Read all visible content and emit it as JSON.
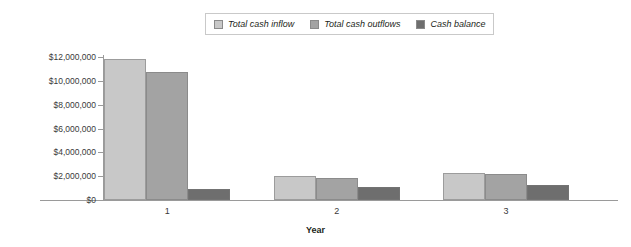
{
  "chart_data": {
    "type": "bar",
    "title": "",
    "subtitle": "",
    "xlabel": "Year",
    "ylabel": "",
    "categories": [
      "1",
      "2",
      "3"
    ],
    "series": [
      {
        "name": "Total cash inflow",
        "color": "#c8c8c8",
        "values": [
          11800000,
          2000000,
          2300000
        ]
      },
      {
        "name": "Total cash outflows",
        "color": "#a3a3a3",
        "values": [
          10750000,
          1850000,
          2150000
        ]
      },
      {
        "name": "Cash balance",
        "color": "#6e6e6e",
        "values": [
          950000,
          1100000,
          1300000
        ]
      }
    ],
    "ylim": [
      0,
      12000000
    ],
    "ytick_values": [
      0,
      2000000,
      4000000,
      6000000,
      8000000,
      10000000,
      12000000
    ],
    "ytick_labels": [
      "$0",
      "$2,000,000",
      "$4,000,000",
      "$6,000,000",
      "$8,000,000",
      "$10,000,000",
      "$12,000,000"
    ],
    "grid": false,
    "legend_position": "top-center",
    "annotations": []
  },
  "legend": {
    "items": [
      {
        "label": "Total cash inflow"
      },
      {
        "label": "Total cash outflows"
      },
      {
        "label": "Cash balance"
      }
    ]
  },
  "axes": {
    "x_title": "Year",
    "x_tick_labels": [
      "1",
      "2",
      "3"
    ],
    "y_tick_labels": [
      "$12,000,000",
      "$10,000,000",
      "$8,000,000",
      "$6,000,000",
      "$4,000,000",
      "$2,000,000",
      "$0"
    ]
  }
}
